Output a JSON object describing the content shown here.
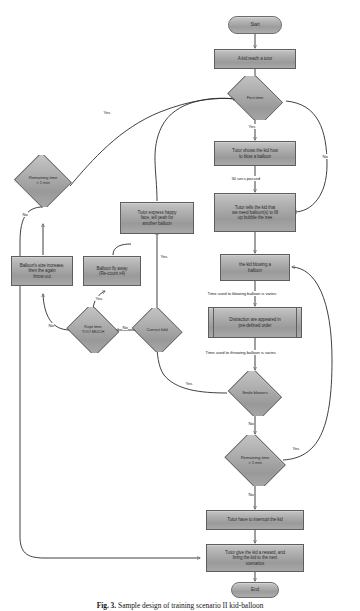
{
  "figure": {
    "caption_label": "Fig. 3.",
    "caption_text": "Sample design of training scenario II kid-balloon"
  },
  "flowchart": {
    "title": "Sample design of training scenario II kid-balloon",
    "nodes": {
      "start": {
        "label": "Start",
        "type": "terminator"
      },
      "kid_reach_tutor": {
        "label": "A kid reach a tutor",
        "type": "process"
      },
      "first_time": {
        "label": "First time",
        "type": "decision"
      },
      "tutor_shows_how": {
        "label": "Tutor shows the kid how\nto blow a balloon",
        "type": "process"
      },
      "tutor_tells_need_balloon": {
        "label": "Tutor tells the kid that\nwe need balloon(s) to fill\nup bubble the tree",
        "type": "process"
      },
      "kid_blowing": {
        "label": "the kid blowing a\nballoon",
        "type": "process"
      },
      "distraction": {
        "label": "Distraction are appeared in\npre-defined order",
        "type": "predefined"
      },
      "smile_blowers": {
        "label": "Smile blowers",
        "type": "decision"
      },
      "remaining_time_right": {
        "label": "Remaining time\n> 1 min",
        "type": "decision"
      },
      "tutor_interrupt": {
        "label": "Tutor have to interrupt the kid",
        "type": "process"
      },
      "tutor_reward": {
        "label": "Tutor give the kid a reward, and\nbring the kid to the next\nscenarios",
        "type": "process"
      },
      "end": {
        "label": "End",
        "type": "terminator"
      },
      "remaining_time_left": {
        "label": "Remaining time\n> 1 min",
        "type": "decision"
      },
      "tutor_express_happy": {
        "label": "Tutor express happy\nface, tell yeah for\nanother balloon",
        "type": "process"
      },
      "balloon_size_increase": {
        "label": "Balloon's size increase,\nthen the again\nthrow out",
        "type": "process"
      },
      "balloon_fly_away": {
        "label": "Balloon fly away\n(Re-count x4)",
        "type": "process"
      },
      "kept_time_too_much": {
        "label": "Kept time\nTOO MUCH",
        "type": "decision"
      },
      "correct_fold": {
        "label": "Correct fold",
        "type": "decision"
      }
    },
    "edge_labels": {
      "first_time_yes": "Yes",
      "first_time_no": "No",
      "secs_passed": "30 secs passed",
      "blowing_varies": "Time used to blowing balloon is varies",
      "throwing_varies": "Time used to throwing balloon is varies",
      "smile_blowers_yes": "Yes",
      "smile_blowers_no": "No",
      "remaining_right_yes": "Yes",
      "remaining_right_no": "No",
      "remaining_left_yes": "Yes",
      "remaining_left_no": "No",
      "kept_time_yes": "Yes",
      "kept_time_no": "No",
      "correct_fold_yes": "Yes",
      "correct_fold_no": "No"
    }
  }
}
